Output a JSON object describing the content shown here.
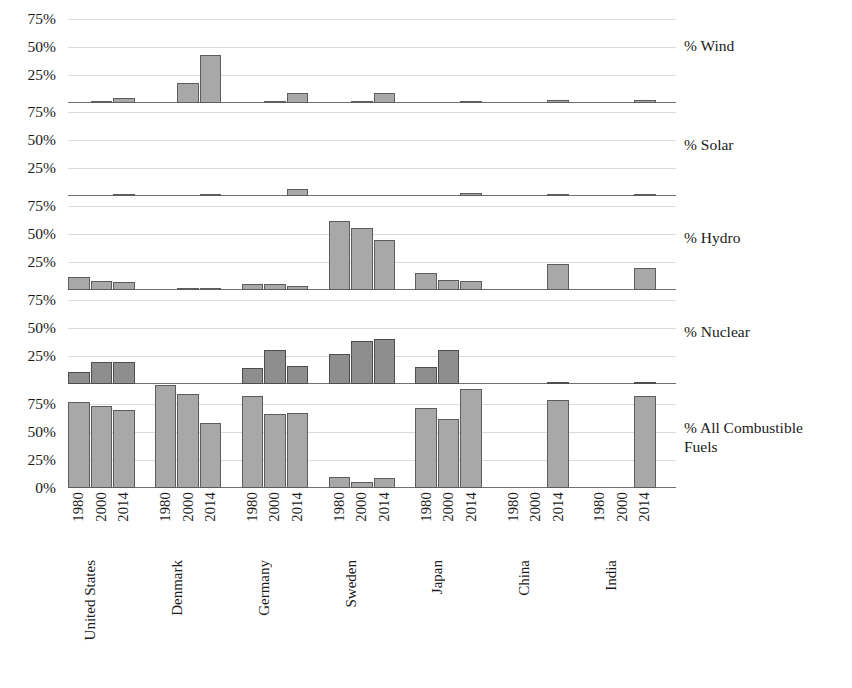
{
  "chart_data": {
    "type": "bar",
    "title": "",
    "subtitle": "",
    "xlabel": "",
    "ylabel": "",
    "grid": true,
    "legend": "none",
    "layout": "small-multiples, 5 stacked panels sharing one x-axis",
    "categories": [
      "United States",
      "Denmark",
      "Germany",
      "Sweden",
      "Japan",
      "China",
      "India"
    ],
    "x": [
      "1980",
      "2000",
      "2014"
    ],
    "ylim": [
      0,
      85
    ],
    "yticks_top_panels": [
      "25%",
      "50%",
      "75%"
    ],
    "yticks_bottom_panel": [
      "0%",
      "25%",
      "50%",
      "75%"
    ],
    "panels": [
      {
        "name": "wind",
        "label": "% Wind",
        "yticks": [
          "75%",
          "50%",
          "25%"
        ],
        "series": [
          {
            "name": "United States",
            "values": [
              0,
              1,
              4.5
            ]
          },
          {
            "name": "Denmark",
            "values": [
              0,
              18,
              43
            ]
          },
          {
            "name": "Germany",
            "values": [
              0,
              2,
              9
            ]
          },
          {
            "name": "Sweden",
            "values": [
              0,
              0.5,
              9
            ]
          },
          {
            "name": "Japan",
            "values": [
              0,
              0,
              1
            ]
          },
          {
            "name": "China",
            "values": [
              0,
              0,
              3
            ]
          },
          {
            "name": "India",
            "values": [
              0,
              0,
              3
            ]
          }
        ]
      },
      {
        "name": "solar",
        "label": "% Solar",
        "yticks": [
          "75%",
          "50%",
          "25%"
        ],
        "series": [
          {
            "name": "United States",
            "values": [
              0,
              0,
              1
            ]
          },
          {
            "name": "Denmark",
            "values": [
              0,
              0,
              2
            ]
          },
          {
            "name": "Germany",
            "values": [
              0,
              0,
              6
            ]
          },
          {
            "name": "Sweden",
            "values": [
              0,
              0,
              0
            ]
          },
          {
            "name": "Japan",
            "values": [
              0,
              0,
              2.5
            ]
          },
          {
            "name": "China",
            "values": [
              0,
              0,
              0.7
            ]
          },
          {
            "name": "India",
            "values": [
              0,
              0,
              0.6
            ]
          }
        ]
      },
      {
        "name": "hydro",
        "label": "% Hydro",
        "yticks": [
          "75%",
          "50%",
          "25%"
        ],
        "series": [
          {
            "name": "United States",
            "values": [
              12,
              8,
              7
            ]
          },
          {
            "name": "Denmark",
            "values": [
              0,
              0.4,
              0.1
            ]
          },
          {
            "name": "Germany",
            "values": [
              5,
              5,
              4
            ]
          },
          {
            "name": "Sweden",
            "values": [
              62,
              55,
              45
            ]
          },
          {
            "name": "Japan",
            "values": [
              15,
              9,
              8
            ]
          },
          {
            "name": "China",
            "values": [
              0,
              0,
              23
            ]
          },
          {
            "name": "India",
            "values": [
              0,
              0,
              20
            ]
          }
        ]
      },
      {
        "name": "nuclear",
        "label": "% Nuclear",
        "yticks": [
          "75%",
          "50%",
          "25%"
        ],
        "series": [
          {
            "name": "United States",
            "values": [
              11,
              20,
              20
            ]
          },
          {
            "name": "Denmark",
            "values": [
              0,
              0,
              0
            ]
          },
          {
            "name": "Germany",
            "values": [
              14,
              30,
              16
            ]
          },
          {
            "name": "Sweden",
            "values": [
              27,
              38,
              40
            ]
          },
          {
            "name": "Japan",
            "values": [
              15,
              30,
              0
            ]
          },
          {
            "name": "China",
            "values": [
              0,
              0,
              1
            ]
          },
          {
            "name": "India",
            "values": [
              0,
              0,
              1.5
            ]
          }
        ]
      },
      {
        "name": "combustible",
        "label": "% All Combustible\nFuels",
        "yticks": [
          "75%",
          "50%",
          "25%",
          "0%"
        ],
        "series": [
          {
            "name": "United States",
            "values": [
              77,
              73,
              70
            ]
          },
          {
            "name": "Denmark",
            "values": [
              92,
              84,
              58
            ]
          },
          {
            "name": "Germany",
            "values": [
              82,
              66,
              67
            ]
          },
          {
            "name": "Sweden",
            "values": [
              10,
              5,
              9
            ]
          },
          {
            "name": "Japan",
            "values": [
              71,
              62,
              88
            ]
          },
          {
            "name": "China",
            "values": [
              0,
              0,
              79
            ]
          },
          {
            "name": "India",
            "values": [
              0,
              0,
              82
            ]
          }
        ]
      }
    ]
  },
  "style": {
    "bar_fill": "#a8a8a8",
    "bar_fill_dark": "#8e8e8e",
    "bar_stroke": "#5d5d5d",
    "gridline": "#cfcfcf",
    "baseline": "#6f6f6f",
    "text": "#1a1a1a",
    "background": "#ffffff"
  }
}
